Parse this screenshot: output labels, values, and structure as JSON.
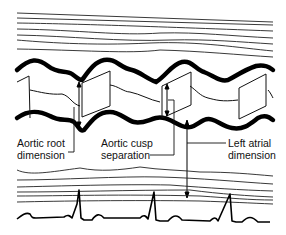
{
  "diagram": {
    "type": "M-mode echocardiogram schematic",
    "labels": {
      "aortic_root": [
        "Aortic root",
        "dimension"
      ],
      "aortic_cusp": [
        "Aortic cusp",
        "separation"
      ],
      "left_atrial": [
        "Left atrial",
        "dimension"
      ]
    },
    "colors": {
      "line": "#111111",
      "background": "#ffffff"
    }
  }
}
